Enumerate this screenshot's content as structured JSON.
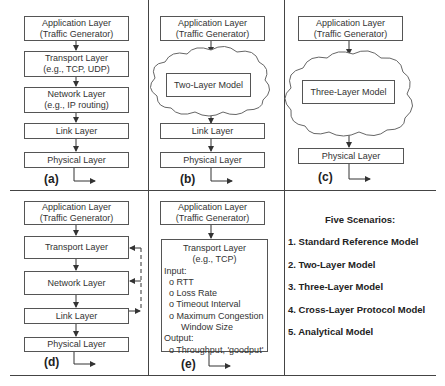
{
  "panels": {
    "a": {
      "label": "(a)",
      "app": [
        "Application Layer",
        "(Traffic Generator)"
      ],
      "transport": [
        "Transport Layer",
        "(e.g., TCP, UDP)"
      ],
      "network": [
        "Network Layer",
        "(e.g., IP routing)"
      ],
      "link": "Link Layer",
      "physical": "Physical Layer"
    },
    "b": {
      "label": "(b)",
      "app": [
        "Application Layer",
        "(Traffic Generator)"
      ],
      "model": "Two-Layer Model",
      "link": "Link Layer",
      "physical": "Physical Layer"
    },
    "c": {
      "label": "(c)",
      "app": [
        "Application Layer",
        "(Traffic Generator)"
      ],
      "model": "Three-Layer Model",
      "physical": "Physical Layer"
    },
    "d": {
      "label": "(d)",
      "app": [
        "Application Layer",
        "(Traffic Generator)"
      ],
      "transport": "Transport Layer",
      "network": "Network Layer",
      "link": "Link Layer",
      "physical": "Physical Layer"
    },
    "e": {
      "label": "(e)",
      "app": [
        "Application Layer",
        "(Traffic Generator)"
      ],
      "transport_title": [
        "Transport Layer",
        "(e.g., TCP)"
      ],
      "input_label": "Input:",
      "inputs": [
        "o RTT",
        "o Loss Rate",
        "o Timeout Interval",
        "o Maximum Congestion",
        "Window Size"
      ],
      "output_label": "Output:",
      "outputs": [
        "o Throughput, 'goodput'"
      ]
    }
  },
  "scenarios": {
    "title": "Five Scenarios:",
    "items": [
      "1. Standard Reference Model",
      "2. Two-Layer Model",
      "3. Three-Layer Model",
      "4. Cross-Layer Protocol Model",
      "5. Analytical Model"
    ]
  }
}
